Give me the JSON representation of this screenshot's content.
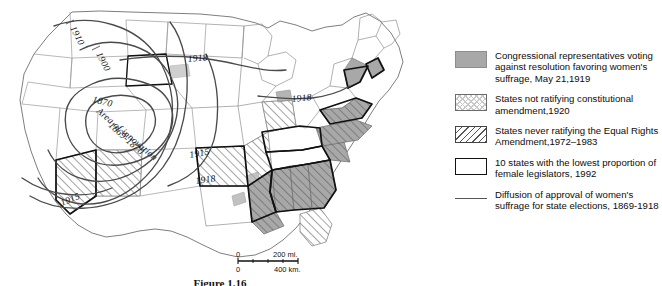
{
  "figure": {
    "caption": "Figure 1.16",
    "title_alt": "Diffusion of women's suffrage in the United States"
  },
  "map": {
    "name": "united-states-map",
    "diffusion_labels": [
      {
        "text": "1910",
        "x": 72,
        "y": 30,
        "rotate": 62
      },
      {
        "text": "1900",
        "x": 98,
        "y": 56,
        "rotate": 62
      },
      {
        "text": "1870",
        "x": 95,
        "y": 101,
        "rotate": 18
      },
      {
        "text": "Area of innovation",
        "x": 100,
        "y": 108,
        "rotate": 40
      },
      {
        "text": "1869-1870",
        "x": 112,
        "y": 122,
        "rotate": 40
      },
      {
        "text": "1918",
        "x": 196,
        "y": 61,
        "rotate": -5
      },
      {
        "text": "1918",
        "x": 299,
        "y": 99,
        "rotate": -6
      },
      {
        "text": "1915",
        "x": 197,
        "y": 157,
        "rotate": -10
      },
      {
        "text": "1918",
        "x": 203,
        "y": 183,
        "rotate": -8
      },
      {
        "text": "1915",
        "x": 72,
        "y": 205,
        "rotate": -22
      }
    ]
  },
  "scalebar": {
    "name": "map-scale-bar",
    "miles_zero": "0",
    "miles_value": "200 mi.",
    "km_zero": "0",
    "km_value": "400 km."
  },
  "legend": {
    "name": "map-legend",
    "items": [
      {
        "swatch": "solid-gray",
        "text": "Congressional representatives voting against resolution favoring women's suffrage, May 21,1919"
      },
      {
        "swatch": "dotted-crosshatch",
        "text": "States not ratifying constitutional amendment,1920"
      },
      {
        "swatch": "diagonal-hatch",
        "text": "States never ratifying the Equal Rights Amendment,1972–1983"
      },
      {
        "swatch": "black-outline",
        "text": "10 states with the lowest proportion of female legislators, 1992"
      },
      {
        "swatch": "gray-line",
        "text": "Diffusion of approval of women's suffrage for state elections, 1869-1918"
      }
    ]
  },
  "colors": {
    "solid_fill": "#a8a8a8",
    "hatch_stroke": "#555555",
    "outline_stroke": "#111111",
    "diffusion_line": "#555555",
    "background": "#ffffff"
  }
}
